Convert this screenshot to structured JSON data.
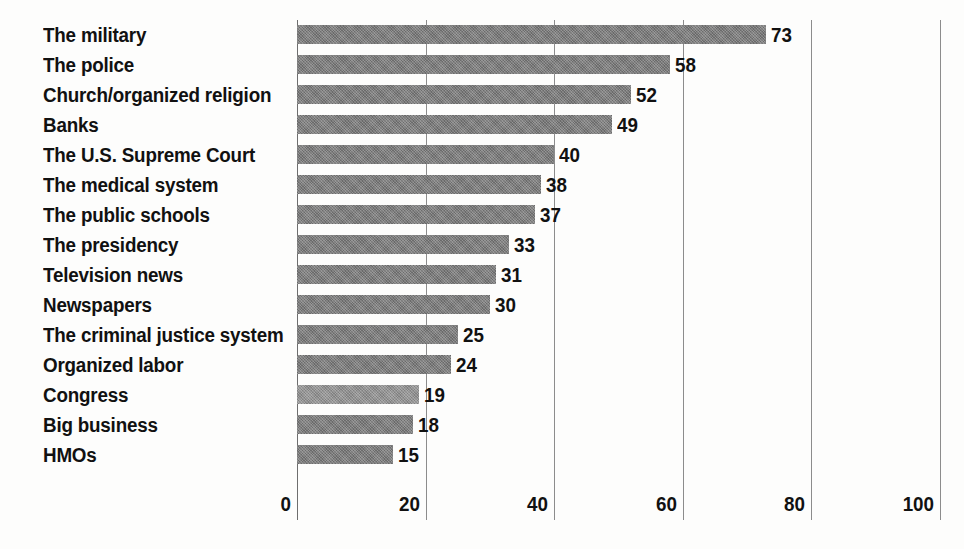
{
  "chart_data": {
    "type": "bar",
    "orientation": "horizontal",
    "title": "",
    "subtitle": "",
    "xlabel": "",
    "ylabel": "",
    "xlim": [
      0,
      100
    ],
    "xticks": [
      "0",
      "20",
      "40",
      "60",
      "80",
      "100"
    ],
    "xtick_values": [
      0,
      20,
      40,
      60,
      80,
      100
    ],
    "grid": "vertical",
    "legend": "none",
    "categories": [
      "The military",
      "The police",
      "Church/organized religion",
      "Banks",
      "The U.S. Supreme Court",
      "The medical system",
      "The public schools",
      "The presidency",
      "Television news",
      "Newspapers",
      "The criminal justice system",
      "Organized labor",
      "Congress",
      "Big business",
      "HMOs"
    ],
    "values": [
      73,
      58,
      52,
      49,
      40,
      38,
      37,
      33,
      31,
      30,
      25,
      24,
      19,
      18,
      15
    ],
    "value_labels": [
      "73",
      "58",
      "52",
      "49",
      "40",
      "38",
      "37",
      "33",
      "31",
      "30",
      "25",
      "24",
      "19",
      "18",
      "15"
    ],
    "bar_color": "#757575",
    "highlight_bar_color": "#8d8d8d",
    "highlight_category": "Congress",
    "gridline_color": "#8c8c8c",
    "text_color": "#111111",
    "background_color": "#fdfdfc"
  }
}
